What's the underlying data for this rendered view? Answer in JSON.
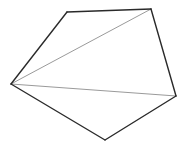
{
  "diagram": {
    "type": "pentagon-triangulation",
    "vertices": [
      {
        "id": "A",
        "x": 11,
        "y": 84
      },
      {
        "id": "B",
        "x": 67,
        "y": 12
      },
      {
        "id": "C",
        "x": 151,
        "y": 9
      },
      {
        "id": "D",
        "x": 176,
        "y": 96
      },
      {
        "id": "E",
        "x": 105,
        "y": 140
      }
    ],
    "edges": [
      [
        "A",
        "B"
      ],
      [
        "B",
        "C"
      ],
      [
        "C",
        "D"
      ],
      [
        "D",
        "E"
      ],
      [
        "E",
        "A"
      ]
    ],
    "diagonals": [
      [
        "A",
        "C"
      ],
      [
        "A",
        "D"
      ]
    ],
    "colors": {
      "edge": "#2a2a2a",
      "diagonal": "#9a9a9a",
      "background": "#ffffff"
    }
  }
}
